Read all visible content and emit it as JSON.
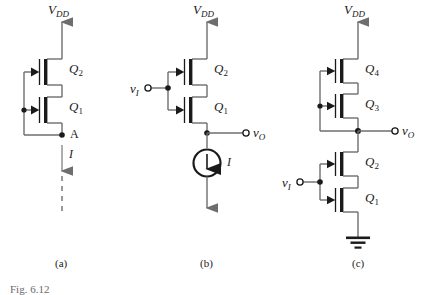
{
  "figure": {
    "caption_prefix": "Fig.",
    "caption_number": "6.12"
  },
  "circuits": [
    {
      "id": "a",
      "panel_label": "(a)",
      "supply_label": "V",
      "supply_sub": "DD",
      "transistors": [
        {
          "name": "Q",
          "sub": "2"
        },
        {
          "name": "Q",
          "sub": "1"
        }
      ],
      "node_label": "A",
      "current_label": "I"
    },
    {
      "id": "b",
      "panel_label": "(b)",
      "supply_label": "V",
      "supply_sub": "DD",
      "input_label": "v",
      "input_sub": "I",
      "output_label": "v",
      "output_sub": "O",
      "transistors": [
        {
          "name": "Q",
          "sub": "2"
        },
        {
          "name": "Q",
          "sub": "1"
        }
      ],
      "current_source_label": "I"
    },
    {
      "id": "c",
      "panel_label": "(c)",
      "supply_label": "V",
      "supply_sub": "DD",
      "input_label": "v",
      "input_sub": "I",
      "output_label": "v",
      "output_sub": "O",
      "transistors": [
        {
          "name": "Q",
          "sub": "4"
        },
        {
          "name": "Q",
          "sub": "3"
        },
        {
          "name": "Q",
          "sub": "2"
        },
        {
          "name": "Q",
          "sub": "1"
        }
      ],
      "ground": "ground-symbol"
    }
  ],
  "colors": {
    "wire": "#6e6e6e",
    "device": "#1a1a1a",
    "text": "#1a1a1a",
    "caption": "#6a6a6a",
    "background": "#ffffff"
  }
}
